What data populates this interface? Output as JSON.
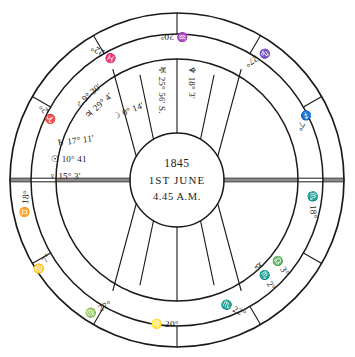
{
  "chart": {
    "ink_color": "#1c1a18",
    "background_color": "#ffffff",
    "center": {
      "year": "1845",
      "date": "1ST JUNE",
      "time": "4.45 A.M."
    },
    "cusps": [
      {
        "id": "cusp-asc",
        "sign": "♊",
        "degree": "18°",
        "text": "♊ 18°",
        "x": 26,
        "y": 204,
        "rotate": -84
      },
      {
        "id": "cusp-house-2",
        "sign": "♋",
        "degree": "7°",
        "text": "♋ 7°",
        "x": 43,
        "y": 264,
        "rotate": -55
      },
      {
        "id": "cusp-house-3",
        "sign": "♍",
        "degree": "27°",
        "text": "♍ 27°",
        "x": 99,
        "y": 310,
        "rotate": -26
      },
      {
        "id": "cusp-ic",
        "sign": "♌",
        "degree": "20°",
        "text": "♌ 20°",
        "x": 165,
        "y": 325,
        "rotate": 0
      },
      {
        "id": "cusp-house-5",
        "sign": "♏",
        "degree": "22°",
        "text": "♏ 22°",
        "x": 233,
        "y": 309,
        "rotate": 27
      },
      {
        "id": "cusp-house-6",
        "sign": "♎",
        "degree": "3°",
        "text": "♎ 3°",
        "x": 280,
        "y": 266,
        "rotate": 56
      },
      {
        "id": "cusp-desc",
        "sign": "♏",
        "degree": "18°",
        "text": "♏ 18°",
        "x": 312,
        "y": 205,
        "rotate": 85
      },
      {
        "id": "cusp-house-8",
        "sign": "♐",
        "degree": "7°",
        "text": "♐ 7°",
        "x": 303,
        "y": 120,
        "rotate": 118
      },
      {
        "id": "cusp-house-9",
        "sign": "♑",
        "degree": "27°",
        "text": "♑ 27°",
        "x": 257,
        "y": 57,
        "rotate": 148
      },
      {
        "id": "cusp-mc",
        "sign": "♒",
        "degree": "20°",
        "text": "♒ 20°",
        "x": 174,
        "y": 36,
        "rotate": 180
      },
      {
        "id": "cusp-house-11",
        "sign": "♓",
        "degree": "22°",
        "text": "♓ 22°",
        "x": 104,
        "y": 53,
        "rotate": 208
      },
      {
        "id": "cusp-house-12",
        "sign": "♈",
        "degree": "2°",
        "text": "♈ 2°",
        "x": 48,
        "y": 114,
        "rotate": 237
      }
    ],
    "planets": [
      {
        "id": "planet-saturn",
        "glyph": "♄",
        "position": "17° 11'",
        "text": "♄ 17° 11'",
        "x": 57,
        "y": 144,
        "rotate": -8,
        "anchor": "start"
      },
      {
        "id": "planet-sun",
        "glyph": "☉",
        "position": "10° 41",
        "text": "☉ 10° 41",
        "x": 51,
        "y": 160,
        "rotate": 0,
        "anchor": "start"
      },
      {
        "id": "planet-venus",
        "glyph": "♀",
        "position": "15° 3'",
        "text": "♀ 15° 3'",
        "x": 49,
        "y": 177,
        "rotate": 0,
        "anchor": "start"
      },
      {
        "id": "planet-mars",
        "glyph": "♂",
        "position": "9° 30'",
        "text": "♂ 9° 30'",
        "x": 77,
        "y": 107,
        "rotate": -42,
        "anchor": "start"
      },
      {
        "id": "planet-jupiter",
        "glyph": "♃",
        "position": "29° 4'",
        "text": "♃ 29° 4'",
        "x": 87,
        "y": 117,
        "rotate": -42,
        "anchor": "start"
      },
      {
        "id": "planet-moon",
        "glyph": "☽",
        "position": "0° 14'",
        "text": "☽ 0° 14'",
        "x": 113,
        "y": 118,
        "rotate": -22,
        "anchor": "start"
      },
      {
        "id": "planet-uranus",
        "glyph": "♅",
        "position": "25° 56' S.",
        "text": "♅ 25° 56' S.",
        "x": 161,
        "y": 66,
        "rotate": 90,
        "anchor": "start"
      },
      {
        "id": "planet-neptune",
        "glyph": "♆",
        "position": "18° 3'",
        "text": "♆ 18° 3'",
        "x": 191,
        "y": 66,
        "rotate": 90,
        "anchor": "start"
      },
      {
        "id": "planet-mercury",
        "glyph": "☿",
        "position": "2°",
        "text": "☿ ♏ 2°",
        "x": 256,
        "y": 264,
        "rotate": 57,
        "anchor": "start"
      }
    ]
  }
}
